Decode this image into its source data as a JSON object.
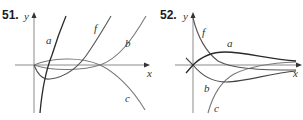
{
  "panels": [
    {
      "number": "51.",
      "axes": {
        "x_label": "x",
        "y_label": "y"
      },
      "curves": [
        {
          "label": "a",
          "description": "steep increasing curve crossing the x-axis just right of origin"
        },
        {
          "label": "f",
          "description": "starts at origin, dips below axis, then rises steeply"
        },
        {
          "label": "b",
          "description": "starts at origin, slight dip, touches axis at double root, then rises"
        },
        {
          "label": "c",
          "description": "starts at origin, small hump above axis, then falls below"
        }
      ]
    },
    {
      "number": "52.",
      "axes": {
        "x_label": "x",
        "y_label": "y"
      },
      "curves": [
        {
          "label": "a",
          "description": "rises from origin to a peak then decays toward horizontal asymptote"
        },
        {
          "label": "f",
          "description": "starts high on y-axis and decreases, crossing below other curves"
        },
        {
          "label": "b",
          "description": "dips from origin to a minimum then rises toward asymptote"
        },
        {
          "label": "c",
          "description": "rises from far below, approaching the asymptote from beneath"
        }
      ]
    }
  ],
  "colors": {
    "axis": "#8a8a8a",
    "dark_curve": "#2a2a2a",
    "light_curve": "#7a7a7a",
    "label": "#333333"
  }
}
